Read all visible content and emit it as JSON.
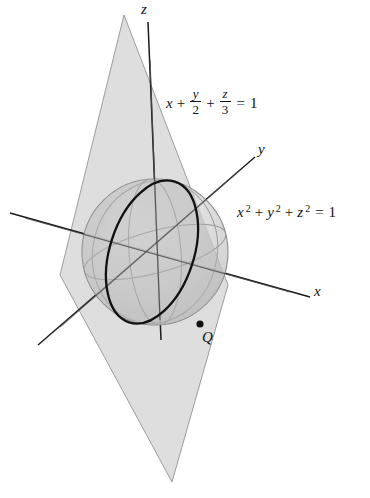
{
  "figure": {
    "width": 370,
    "height": 498,
    "background_color": "#ffffff"
  },
  "axes": {
    "origin": {
      "x": 155,
      "y": 252
    },
    "items": [
      {
        "name": "z",
        "label": "z",
        "label_pos": {
          "x": 141,
          "y": 4
        },
        "start": {
          "x": 148,
          "y": 22
        },
        "end": {
          "x": 161,
          "y": 340
        }
      },
      {
        "name": "y",
        "label": "y",
        "label_pos": {
          "x": 258,
          "y": 143
        },
        "start": {
          "x": 255,
          "y": 157
        },
        "end": {
          "x": 38,
          "y": 345
        }
      },
      {
        "name": "x",
        "label": "x",
        "label_pos": {
          "x": 314,
          "y": 284
        },
        "start": {
          "x": 310,
          "y": 297
        },
        "end": {
          "x": 10,
          "y": 213
        }
      }
    ],
    "stroke_color": "#1a1a1a",
    "stroke_width": 1.4
  },
  "sphere": {
    "center": {
      "x": 155,
      "y": 252
    },
    "radius": 73,
    "fill_color": "#cfcfcf",
    "fill_opacity": 0.55,
    "outline_color": "#8a8a8a",
    "equation_text_parts": {
      "x": "x",
      "y": "y",
      "z": "z",
      "exponent": "2",
      "equals": "=",
      "rhs": "1"
    },
    "equation_plain": "x^2 + y^2 + z^2 = 1",
    "equation_pos": {
      "x": 237,
      "y": 206
    }
  },
  "plane": {
    "vertices": [
      {
        "x": 124,
        "y": 15
      },
      {
        "x": 228,
        "y": 285
      },
      {
        "x": 172,
        "y": 482
      },
      {
        "x": 60,
        "y": 275
      }
    ],
    "fill_color": "#c9c9c9",
    "fill_opacity": 0.65,
    "outline_color": "#9a9a9a",
    "equation_plain": "x + y/2 + z/3 = 1",
    "equation_pos": {
      "x": 166,
      "y": 90
    },
    "equation_parts": {
      "x": "x",
      "plus1": "+",
      "frac1_num": "y",
      "frac1_den": "2",
      "plus2": "+",
      "frac2_num": "z",
      "frac2_den": "3",
      "equals": "=",
      "rhs": "1"
    }
  },
  "intersection_curve": {
    "name": "circle-of-intersection",
    "stroke_color": "#111111",
    "stroke_width": 2.3,
    "description": "bold tilted ellipse where plane cuts sphere"
  },
  "point_q": {
    "label": "Q",
    "marker_pos": {
      "x": 200,
      "y": 324
    },
    "label_pos": {
      "x": 202,
      "y": 331
    },
    "marker_radius": 3.6,
    "marker_color": "#111111"
  },
  "guide_ellipses": {
    "stroke_color": "#9a9a9a",
    "stroke_width": 1.0,
    "count": 3
  }
}
